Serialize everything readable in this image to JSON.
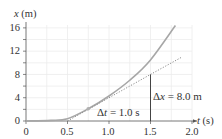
{
  "chart_data": {
    "type": "line",
    "title": "",
    "xlabel": "t (s)",
    "ylabel": "x (m)",
    "xlim": [
      0,
      2.0
    ],
    "ylim": [
      0,
      17
    ],
    "x_ticks": [
      "0",
      "0.5",
      "1.0",
      "1.5",
      "2.0"
    ],
    "y_ticks": [
      "0",
      "4",
      "8",
      "12",
      "16"
    ],
    "grid": true,
    "series": [
      {
        "name": "position curve",
        "style": "solid",
        "x": [
          0,
          0.3,
          0.5,
          0.75,
          1.0,
          1.25,
          1.5,
          1.8
        ],
        "values": [
          0,
          0.1,
          0.4,
          2.1,
          4.3,
          7.0,
          10.5,
          16.4
        ]
      },
      {
        "name": "tangent line",
        "style": "dotted",
        "x": [
          0.5,
          1.5,
          1.88
        ],
        "values": [
          0,
          8.0,
          11.0
        ]
      }
    ],
    "annotations": [
      {
        "text_prefix": "Δ",
        "var": "t",
        "text_suffix": " = 1.0 s",
        "label": "Δt = 1.0 s"
      },
      {
        "text_prefix": "Δ",
        "var": "x",
        "text_suffix": " = 8.0 m",
        "label": "Δx = 8.0 m"
      }
    ],
    "marked_point": {
      "t": 0.75,
      "x": 2.1
    }
  },
  "axes": {
    "y_title_var": "x",
    "y_title_unit": " (m)",
    "x_title_var": "t",
    "x_title_unit": " (s)"
  },
  "colors": {
    "curve": "#a7a7a7",
    "tangent": "#8c8c8c",
    "grid": "#ececec",
    "axis": "#555555",
    "marker": "#b0b0b0"
  }
}
